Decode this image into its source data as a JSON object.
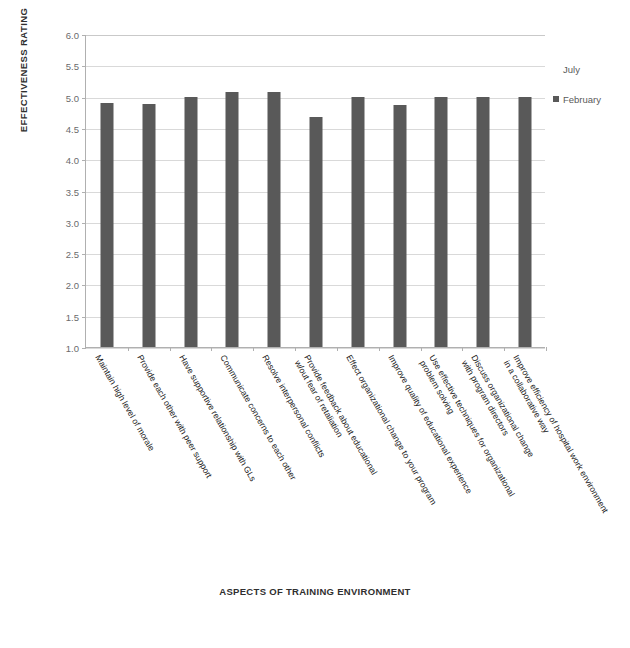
{
  "chart_data": {
    "type": "bar",
    "title": "",
    "xlabel": "ASPECTS OF TRAINING ENVIRONMENT",
    "ylabel": "EFFECTIVENESS RATING",
    "ylim": [
      1.0,
      6.0
    ],
    "ytick_step": 0.5,
    "ytick_labels": [
      "6.0",
      "5.5",
      "5.0",
      "4.5",
      "4.0",
      "3.5",
      "3.0",
      "2.5",
      "2.0",
      "1.5",
      "1.0"
    ],
    "grid": true,
    "legend_position": "right",
    "categories": [
      "Maintain high level of morale",
      "Provide each other with peer support",
      "Have supportive relationship with GLs",
      "Communicate concerns to each other",
      "Resolve interpersonal conflicts",
      "Provide feedback about educational",
      "Effect organizational change to your program",
      "Improve quality of educational experience",
      "Use effective techniques for organizational",
      "Discuss organizational change",
      "Improve efficiency of hospital work environment"
    ],
    "category_line2": [
      "",
      "",
      "",
      "",
      "",
      "w/out fear of retaliation",
      "",
      "",
      "problem solving",
      "with program directors",
      "in a collaborative way"
    ],
    "series": [
      {
        "name": "July",
        "color": "#ffffff",
        "values": [
          null,
          null,
          null,
          null,
          null,
          null,
          null,
          null,
          null,
          null,
          null
        ]
      },
      {
        "name": "February",
        "color": "#595959",
        "values": [
          4.9,
          4.89,
          5.0,
          5.08,
          5.08,
          4.67,
          5.0,
          4.87,
          5.0,
          5.0,
          5.0
        ]
      }
    ]
  },
  "legend": {
    "items": [
      {
        "label": "July",
        "color": "#ffffff",
        "has_marker": false
      },
      {
        "label": "February",
        "color": "#595959",
        "has_marker": true
      }
    ]
  },
  "axes": {
    "y_title": "EFFECTIVENESS RATING",
    "x_title": "ASPECTS OF TRAINING ENVIRONMENT"
  },
  "colors": {
    "bar_february": "#595959",
    "bar_july": "#ffffff",
    "gridline": "#d9d9d9",
    "axis_line": "#b0b0b0",
    "tick_text": "#6b6b6b",
    "title_text": "#2f2f2f",
    "category_text": "#1a1a1a",
    "background": "#ffffff"
  }
}
